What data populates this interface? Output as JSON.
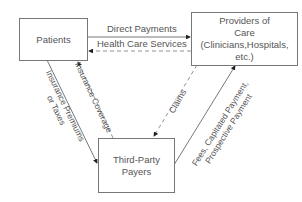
{
  "diagram": {
    "nodes": {
      "patients": {
        "label": "Patients"
      },
      "providers": {
        "line1": "Providers of",
        "line2": "Care",
        "line3": "(Clinicians,Hospitals,",
        "line4": "etc.)"
      },
      "third_party": {
        "line1": "Third-Party",
        "line2": "Payers"
      }
    },
    "edges": {
      "direct_payments": {
        "label": "Direct Payments",
        "from": "Patients",
        "to": "Providers of Care",
        "style": "solid"
      },
      "health_care_services": {
        "label": "Health Care Services",
        "from": "Providers of Care",
        "to": "Patients",
        "style": "dashed"
      },
      "premiums": {
        "line1": "Insurance Premiums",
        "line2": "or Taxes",
        "from": "Patients",
        "to": "Third-Party Payers",
        "style": "solid"
      },
      "coverage": {
        "label": "Insurance Coverage",
        "from": "Third-Party Payers",
        "to": "Patients",
        "style": "dashed"
      },
      "claims": {
        "label": "Claims",
        "from": "Providers of Care",
        "to": "Third-Party Payers",
        "style": "dashed"
      },
      "fees": {
        "line1": "Fees, Capitated Payment,",
        "line2": "Prospective Payment",
        "from": "Third-Party Payers",
        "to": "Providers of Care",
        "style": "solid"
      }
    }
  }
}
